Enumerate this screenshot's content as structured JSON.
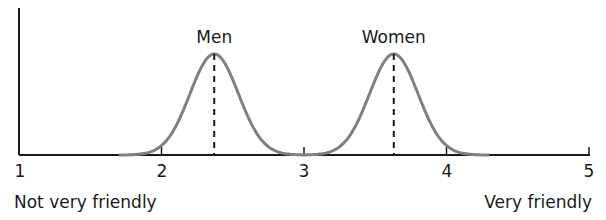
{
  "chart_data": {
    "type": "line",
    "title": "",
    "xlabel": "",
    "ylabel": "",
    "xlim": [
      1,
      5
    ],
    "x_ticks": [
      1,
      2,
      3,
      4,
      5
    ],
    "x_tick_labels": [
      "1",
      "2",
      "3",
      "4",
      "5"
    ],
    "x_axis_end_labels": {
      "left": "Not very friendly",
      "right": "Very friendly"
    },
    "grid": false,
    "legend": "none (series labeled above peaks)",
    "series": [
      {
        "name": "Men",
        "distribution": "normal",
        "mean": 2.37,
        "sd": 0.17,
        "range": [
          1.7,
          3.0
        ],
        "mean_marker": "dashed vertical line"
      },
      {
        "name": "Women",
        "distribution": "normal",
        "mean": 3.63,
        "sd": 0.17,
        "range": [
          3.0,
          4.3
        ],
        "mean_marker": "dashed vertical line"
      }
    ],
    "colors": {
      "curve": "#808080",
      "axis": "#1a1a1a",
      "mean_line": "#1a1a1a"
    }
  },
  "labels": {
    "men": "Men",
    "women": "Women",
    "left_end": "Not very friendly",
    "right_end": "Very friendly",
    "ticks": [
      "1",
      "2",
      "3",
      "4",
      "5"
    ]
  }
}
